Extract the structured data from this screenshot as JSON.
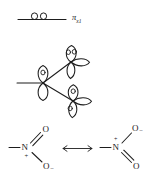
{
  "figure": {
    "ink_color": "#1d1d1d",
    "background_color": "#ffffff"
  },
  "mo_level": {
    "name": "pi molecular orbital energy level",
    "label_pi": "π",
    "label_subscript": "x1",
    "electron_count": 2,
    "electrons": [
      "electron-1",
      "electron-2"
    ]
  },
  "orbital_sketch": {
    "name": "p-orbital overlap sketch",
    "atoms": [
      {
        "id": "center-n",
        "role": "nitrogen",
        "orbital": "p-orbital",
        "electron_dots": 1
      },
      {
        "id": "upper-o",
        "role": "oxygen",
        "orbital": "p-orbital",
        "electron_dots": 2
      },
      {
        "id": "lower-o",
        "role": "oxygen",
        "orbital": "p-orbital",
        "electron_dots": 2
      }
    ],
    "bonds": [
      "n-to-upper-o",
      "n-to-lower-o",
      "n-to-substituent"
    ]
  },
  "resonance": {
    "name": "resonance pair",
    "arrow": "double-headed-resonance-arrow",
    "structures": [
      {
        "id": "structure-left",
        "nitrogen": "N",
        "nitrogen_charge": "+",
        "top_oxygen": "O",
        "top_oxygen_charge": "",
        "top_bond": "double",
        "bottom_oxygen": "O",
        "bottom_oxygen_charge": "–",
        "bottom_bond": "single"
      },
      {
        "id": "structure-right",
        "nitrogen": "N",
        "nitrogen_charge": "+",
        "top_oxygen": "O",
        "top_oxygen_charge": "–",
        "top_bond": "single",
        "bottom_oxygen": "O",
        "bottom_oxygen_charge": "",
        "bottom_bond": "double"
      }
    ]
  }
}
